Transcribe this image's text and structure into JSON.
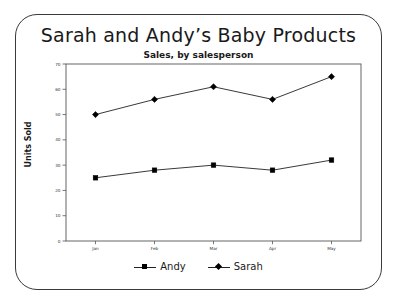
{
  "chart_data": {
    "type": "line",
    "title": "Sarah and Andy’s Baby Products",
    "subtitle": "Sales, by salesperson",
    "xlabel": "",
    "ylabel": "Units Sold",
    "categories": [
      "Jan",
      "Feb",
      "Mar",
      "Apr",
      "May"
    ],
    "series": [
      {
        "name": "Andy",
        "marker": "square",
        "color": "#000000",
        "values": [
          25,
          28,
          30,
          28,
          32
        ]
      },
      {
        "name": "Sarah",
        "marker": "diamond",
        "color": "#000000",
        "values": [
          50,
          56,
          61,
          56,
          65
        ]
      }
    ],
    "ylim": [
      0,
      70
    ],
    "yticks": [
      0,
      10,
      20,
      30,
      40,
      50,
      60,
      70
    ],
    "ytick_labels": [
      "0",
      "10",
      "20",
      "30",
      "40",
      "50",
      "60",
      "70"
    ],
    "grid": false,
    "legend_position": "bottom",
    "line_color": "#222222",
    "axis_color": "#555555",
    "frame_color": "#3a3a3a",
    "background": "#ffffff"
  },
  "legend": {
    "items": [
      {
        "label": "Andy"
      },
      {
        "label": "Sarah"
      }
    ]
  }
}
